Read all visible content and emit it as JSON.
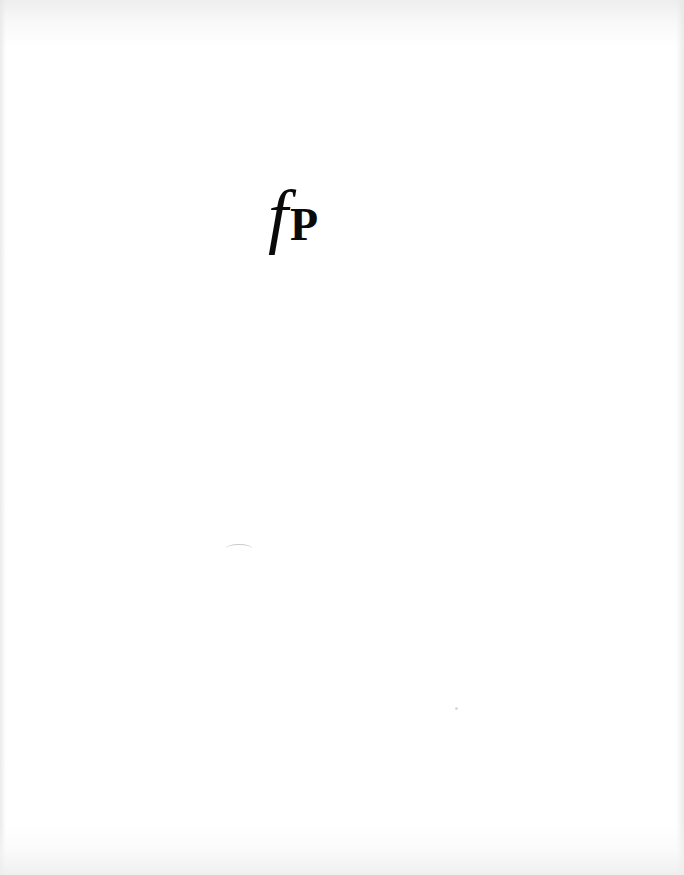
{
  "page": {
    "type": "scanned-book-page",
    "background_color": "#ffffff"
  },
  "logo": {
    "letter_italic": "f",
    "letter_bold": "P",
    "color": "#0a0a0a"
  }
}
